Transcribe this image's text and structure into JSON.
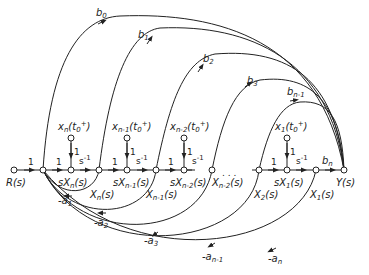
{
  "figure": {
    "type": "signal-flow-graph"
  },
  "nodes": {
    "input": "R(s)",
    "output": "Y(s)",
    "state_derivs": [
      "sXn(s)",
      "sXn-1(s)",
      "sXn-2(s)",
      "sX1(s)"
    ],
    "states": [
      "Xn(s)",
      "Xn-1(s)",
      "Xn-2(s)",
      "X2(s)",
      "X1(s)"
    ],
    "initial_conditions": [
      "xn(t0+)",
      "xn-1(t0+)",
      "xn-2(t0+)",
      "x1(t0+)"
    ],
    "ellipsis": ". . ."
  },
  "labels": {
    "R": "R(s)",
    "Y": "Y(s)",
    "sXn": "sX",
    "sXn_sub": "n",
    "sXn1": "sX",
    "sXn1_sub": "n-1",
    "sXn2": "sX",
    "sXn2_sub": "n-2",
    "sX1": "sX",
    "sX1_sub": "1",
    "Xn": "X",
    "Xn_sub": "n",
    "Xn1": "X",
    "Xn1_sub": "n-1",
    "Xn2": "X",
    "Xn2_sub": "n-2",
    "X2": "X",
    "X2_sub": "2",
    "X1": "X",
    "X1_sub": "1",
    "arg": "(s)",
    "ic_n": "x",
    "ic_n_sub": "n",
    "ic_n1": "x",
    "ic_n1_sub": "n-1",
    "ic_n2": "x",
    "ic_n2_sub": "n-2",
    "ic_1": "x",
    "ic_1_sub": "1",
    "ic_arg": "(t",
    "ic_arg_sub": "0",
    "ic_arg_sup": "+",
    "ic_close": ")",
    "ellipsis": ". . ."
  },
  "gains": {
    "one": "1",
    "s_inv": "s",
    "s_inv_sup": "-1",
    "b0": "b",
    "b0_sub": "0",
    "b1": "b",
    "b1_sub": "1",
    "b2": "b",
    "b2_sub": "2",
    "b3": "b",
    "b3_sub": "3",
    "bn1": "b",
    "bn1_sub": "n-1",
    "bn": "b",
    "bn_sub": "n",
    "a1": "-a",
    "a1_sub": "1",
    "a2": "-a",
    "a2_sub": "2",
    "a3": "-a",
    "a3_sub": "3",
    "an1": "-a",
    "an1_sub": "n-1",
    "an": "-a",
    "an_sub": "n"
  },
  "colors": {
    "stroke": "#222222",
    "background": "#ffffff"
  }
}
